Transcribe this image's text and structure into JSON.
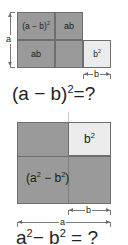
{
  "figures": [
    {
      "id": "difference-of-squares-expansion",
      "equation": {
        "lead": "(a − b)",
        "exp": "2",
        "tail": "=?"
      },
      "cells": [
        {
          "name": "a-minus-b-squared",
          "base": "(a − b)",
          "exp": "2",
          "shade": "dark"
        },
        {
          "name": "ab-top-right",
          "base": "ab",
          "exp": "",
          "shade": "dark"
        },
        {
          "name": "ab-bottom-left",
          "base": "ab",
          "exp": "",
          "shade": "dark"
        },
        {
          "name": "b-squared",
          "base": "b",
          "exp": "2",
          "shade": "light"
        }
      ],
      "dimensions": [
        {
          "name": "height-a",
          "label": "a",
          "orientation": "vertical"
        },
        {
          "name": "width-b",
          "label": "b",
          "orientation": "horizontal"
        }
      ]
    },
    {
      "id": "difference-of-squares-figure",
      "equation": {
        "lead": "a",
        "exp": "2",
        "mid": "− b",
        "exp2": "2",
        "tail": "= ?"
      },
      "cells": [
        {
          "name": "b-squared-corner",
          "base": "b",
          "exp": "2",
          "shade": "light"
        },
        {
          "name": "a-squared-minus-b-squared",
          "base": "(a",
          "exp": "2",
          "mid": "−",
          "base2": "b",
          "exp2": "2",
          "tail": ")",
          "shade": "dark"
        }
      ],
      "dimensions": [
        {
          "name": "width-b",
          "label": "b",
          "orientation": "horizontal"
        },
        {
          "name": "width-a",
          "label": "a",
          "orientation": "horizontal"
        }
      ]
    }
  ],
  "colors": {
    "shade_dark": "#9a9a9a",
    "shade_light": "#ececec",
    "stroke": "#6e6e6e",
    "text": "#1b1b1b",
    "background": "#ffffff"
  }
}
